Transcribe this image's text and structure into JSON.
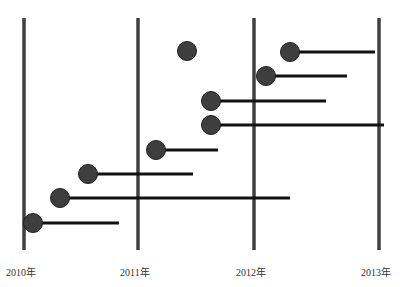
{
  "chart_data": {
    "type": "timeline",
    "title": "",
    "axis_labels": [
      "2010年",
      "2011年",
      "2012年",
      "2013年"
    ],
    "axis_x": [
      24,
      138,
      254,
      379
    ],
    "axis_top": 18,
    "axis_bottom": 250,
    "events": [
      {
        "start_x": 187,
        "y": 51,
        "end_x": null,
        "start_year": 2011.43,
        "end_year": null
      },
      {
        "start_x": 290,
        "y": 52,
        "end_x": 375,
        "start_year": 2012.29,
        "end_year": 2012.97
      },
      {
        "start_x": 266,
        "y": 76,
        "end_x": 347,
        "start_year": 2012.1,
        "end_year": 2012.74
      },
      {
        "start_x": 211,
        "y": 101,
        "end_x": 326,
        "start_year": 2011.63,
        "end_year": 2012.58
      },
      {
        "start_x": 211,
        "y": 125,
        "end_x": 384,
        "start_year": 2011.63,
        "end_year": 2013.04
      },
      {
        "start_x": 156,
        "y": 150,
        "end_x": 218,
        "start_year": 2011.16,
        "end_year": 2011.69
      },
      {
        "start_x": 88,
        "y": 174,
        "end_x": 193,
        "start_year": 2010.56,
        "end_year": 2011.47
      },
      {
        "start_x": 60,
        "y": 198,
        "end_x": 290,
        "start_year": 2010.32,
        "end_year": 2012.29
      },
      {
        "start_x": 33,
        "y": 223,
        "end_x": 119,
        "start_year": 2010.08,
        "end_year": 2010.83
      }
    ],
    "colors": {
      "axis": "#404040",
      "dot": "#3e3e3e",
      "line": "#111111"
    }
  }
}
